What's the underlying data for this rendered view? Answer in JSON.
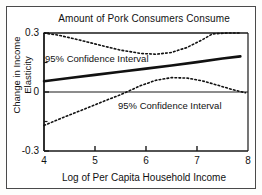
{
  "chart_data": {
    "type": "line",
    "title": "Amount of Pork Consumers Consume",
    "xlabel": "Log of Per Capita Household Income",
    "ylabel": "Change in Income Elasticity",
    "xlim": [
      4,
      8
    ],
    "ylim": [
      -0.3,
      0.3
    ],
    "grid": false,
    "legend": "none",
    "xticks": [
      4,
      5,
      6,
      7,
      8
    ],
    "xtick_labels": [
      "4",
      "5",
      "6",
      "7",
      "8"
    ],
    "yticks": [
      -0.3,
      0,
      0.3
    ],
    "ytick_labels": [
      "-0.3",
      "0",
      "0.3"
    ],
    "yminor_ticks": [
      -0.15,
      0.15
    ],
    "zero_line": 0,
    "series": [
      {
        "name": "Estimated change in income elasticity",
        "style": "solid",
        "width": 2.6,
        "color": "#111111",
        "x": [
          4.0,
          4.5,
          5.0,
          5.5,
          6.0,
          6.5,
          7.0,
          7.5,
          7.85
        ],
        "values": [
          0.055,
          0.071,
          0.087,
          0.103,
          0.119,
          0.135,
          0.152,
          0.17,
          0.181
        ]
      },
      {
        "name": "95% Confidence Interval (upper)",
        "style": "dotted",
        "width": 1.6,
        "color": "#111111",
        "x": [
          4.0,
          4.3,
          4.7,
          5.1,
          5.5,
          5.9,
          6.2,
          6.5,
          6.8,
          7.1,
          7.3,
          7.6,
          7.85
        ],
        "values": [
          0.3,
          0.288,
          0.264,
          0.238,
          0.213,
          0.196,
          0.192,
          0.201,
          0.226,
          0.265,
          0.295,
          0.3,
          0.3
        ]
      },
      {
        "name": "95% Confidence Interval (lower)",
        "style": "dotted",
        "width": 1.6,
        "color": "#111111",
        "x": [
          4.0,
          4.4,
          4.8,
          5.2,
          5.5,
          5.9,
          6.2,
          6.5,
          6.8,
          7.1,
          7.4,
          7.7,
          7.95
        ],
        "values": [
          -0.17,
          -0.127,
          -0.086,
          -0.044,
          -0.014,
          0.033,
          0.06,
          0.073,
          0.071,
          0.057,
          0.035,
          0.012,
          -0.004
        ]
      }
    ],
    "annotations": [
      {
        "text": "95% Confidence Interval",
        "x": 4.3,
        "y": 0.23
      },
      {
        "text": "95% Confidence Interval",
        "x": 5.85,
        "y": -0.075
      }
    ]
  }
}
